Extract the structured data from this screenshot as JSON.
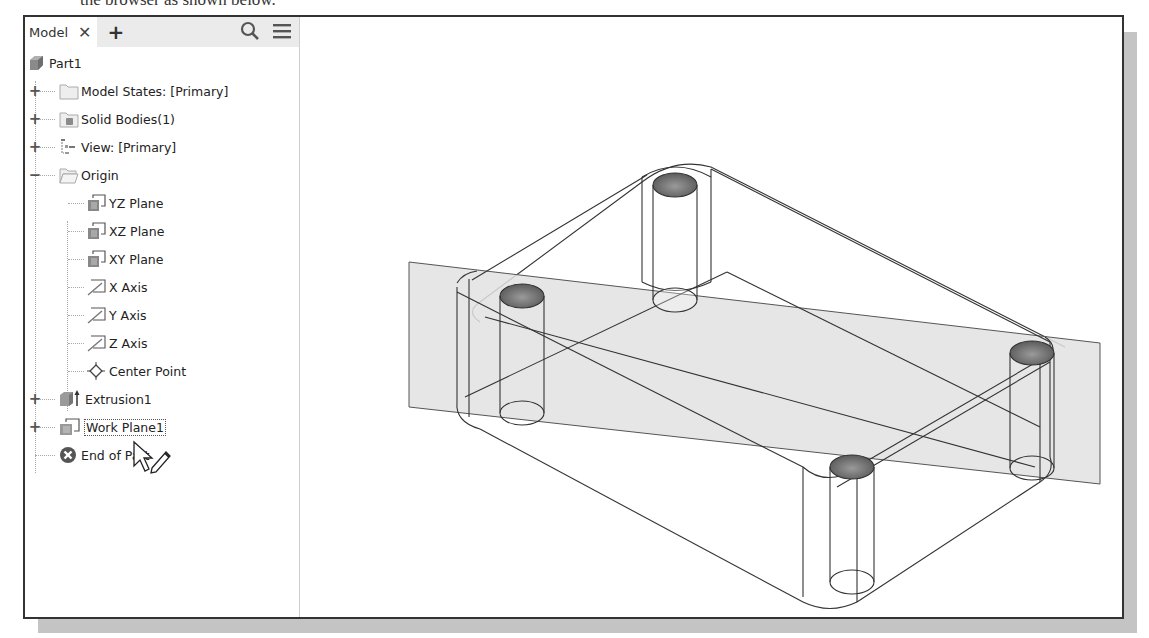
{
  "caption_fragment": "the browser as shown below.",
  "browser": {
    "tabs": [
      {
        "label": "Model",
        "close_icon": "close-icon"
      }
    ],
    "add_tab_icon": "plus-icon",
    "search_icon": "search-icon",
    "menu_icon": "hamburger-menu-icon",
    "tree": {
      "root": {
        "label": "Part1",
        "icon": "part-icon"
      },
      "items": [
        {
          "label": "Model States: [Primary]",
          "icon": "folder-icon",
          "expander": "+"
        },
        {
          "label": "Solid Bodies(1)",
          "icon": "solid-body-folder-icon",
          "expander": "+"
        },
        {
          "label": "View: [Primary]",
          "icon": "view-rep-icon",
          "expander": "+"
        },
        {
          "label": "Origin",
          "icon": "folder-open-icon",
          "expander": "−",
          "children": [
            {
              "label": "YZ Plane",
              "icon": "work-plane-icon"
            },
            {
              "label": "XZ Plane",
              "icon": "work-plane-icon"
            },
            {
              "label": "XY Plane",
              "icon": "work-plane-icon"
            },
            {
              "label": "X Axis",
              "icon": "work-axis-icon"
            },
            {
              "label": "Y Axis",
              "icon": "work-axis-icon"
            },
            {
              "label": "Z Axis",
              "icon": "work-axis-icon"
            },
            {
              "label": "Center Point",
              "icon": "work-point-icon"
            }
          ]
        },
        {
          "label": "Extrusion1",
          "icon": "extrusion-icon",
          "expander": "+"
        },
        {
          "label": "Work Plane1",
          "icon": "work-plane-icon",
          "expander": "+",
          "selected": true
        },
        {
          "label": "End of Part",
          "icon": "end-of-part-icon"
        }
      ]
    }
  },
  "viewport": {
    "model": "rounded rectangular plate with four through-holes, wireframe view",
    "work_plane": "Work Plane1 (shaded diagonal plane through model)"
  },
  "colors": {
    "frame_border": "#333333",
    "shadow": "#c4c4c4",
    "work_plane_fill": "#e2e2e2",
    "hole_top_fill": "#6e6e6e",
    "edge": "#333333"
  }
}
